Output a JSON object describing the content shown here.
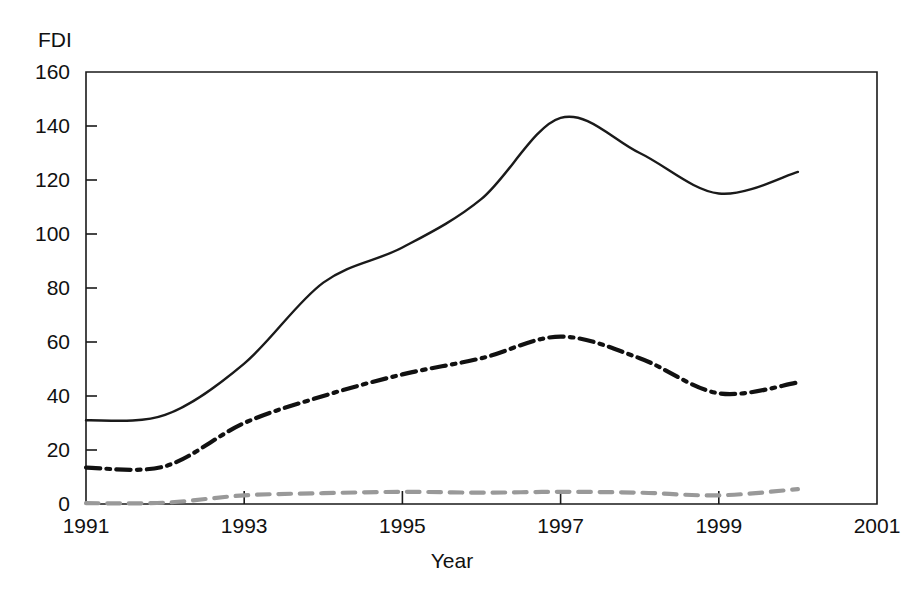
{
  "chart_data": {
    "type": "line",
    "title": "",
    "ylabel": "FDI",
    "xlabel": "Year",
    "xlim": [
      1991,
      2001
    ],
    "ylim": [
      0,
      160
    ],
    "grid": false,
    "legend": "none",
    "x_tick_labels": [
      "1991",
      "1993",
      "1995",
      "1997",
      "1999",
      "2001"
    ],
    "x_ticks": [
      1991,
      1993,
      1995,
      1997,
      1999,
      2001
    ],
    "y_tick_labels": [
      "0",
      "20",
      "40",
      "60",
      "80",
      "100",
      "120",
      "140",
      "160"
    ],
    "y_ticks": [
      0,
      20,
      40,
      60,
      80,
      100,
      120,
      140,
      160
    ],
    "x": [
      1991,
      1992,
      1993,
      1994,
      1995,
      1996,
      1997,
      1998,
      1999,
      2000
    ],
    "series": [
      {
        "name": "world-total",
        "style": "solid",
        "color": "#1a1a1a",
        "width": 2.4,
        "values": [
          31,
          33,
          52,
          82,
          95,
          113,
          143,
          130,
          115,
          123
        ]
      },
      {
        "name": "developed-economies",
        "style": "dash-dot",
        "color": "#111111",
        "width": 4.2,
        "values": [
          13.5,
          14,
          30,
          40,
          48,
          54,
          62,
          54,
          41,
          45
        ]
      },
      {
        "name": "least-developed-economies",
        "style": "dashed",
        "color": "#999999",
        "width": 4.2,
        "values": [
          0.3,
          0.5,
          3.2,
          4,
          4.5,
          4.2,
          4.5,
          4.2,
          3.2,
          5.5
        ]
      }
    ]
  }
}
